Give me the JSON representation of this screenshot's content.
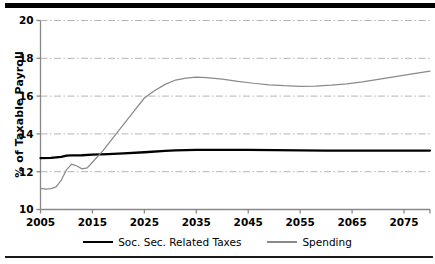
{
  "chart_data": {
    "type": "line",
    "title": "",
    "xlabel": "",
    "ylabel": "% of Taxable Payroll",
    "xlim": [
      2005,
      2080
    ],
    "ylim": [
      10,
      20
    ],
    "yticks": [
      10,
      12,
      14,
      16,
      18,
      20
    ],
    "xticks": [
      2005,
      2015,
      2025,
      2035,
      2045,
      2055,
      2065,
      2075
    ],
    "grid": "horizontal dash-dot gridlines at 12, 14, 16, 18, 20",
    "legend_position": "bottom-center",
    "series": [
      {
        "name": "Soc. Sec. Related Taxes",
        "color": "#000000",
        "x": [
          2005,
          2007,
          2009,
          2010,
          2011,
          2013,
          2015,
          2018,
          2021,
          2025,
          2029,
          2031,
          2035,
          2040,
          2045,
          2050,
          2055,
          2060,
          2065,
          2070,
          2075,
          2080
        ],
        "values": [
          12.72,
          12.73,
          12.78,
          12.85,
          12.86,
          12.87,
          12.9,
          12.93,
          12.97,
          13.03,
          13.1,
          13.13,
          13.15,
          13.15,
          13.15,
          13.14,
          13.13,
          13.12,
          13.12,
          13.12,
          13.12,
          13.12
        ]
      },
      {
        "name": "Spending",
        "color": "#8a8a8a",
        "x": [
          2005,
          2006,
          2007,
          2008,
          2009,
          2010,
          2011,
          2012,
          2013,
          2014,
          2015,
          2017,
          2019,
          2021,
          2023,
          2025,
          2027,
          2029,
          2031,
          2033,
          2035,
          2037,
          2040,
          2043,
          2046,
          2049,
          2052,
          2055,
          2058,
          2061,
          2064,
          2067,
          2070,
          2073,
          2076,
          2080
        ],
        "values": [
          11.12,
          11.08,
          11.1,
          11.2,
          11.55,
          12.1,
          12.4,
          12.3,
          12.15,
          12.2,
          12.5,
          13.1,
          13.8,
          14.5,
          15.2,
          15.9,
          16.3,
          16.62,
          16.85,
          16.95,
          17.0,
          16.98,
          16.9,
          16.78,
          16.68,
          16.6,
          16.55,
          16.52,
          16.53,
          16.58,
          16.65,
          16.75,
          16.88,
          17.02,
          17.15,
          17.32
        ]
      }
    ]
  },
  "axis": {
    "y_title": "% of Taxable Payroll",
    "y_tick_labels": [
      "20",
      "18",
      "16",
      "14",
      "12",
      "10"
    ],
    "x_tick_labels": [
      "2005",
      "2015",
      "2025",
      "2035",
      "2045",
      "2055",
      "2065",
      "2075"
    ]
  },
  "legend": {
    "entries": [
      {
        "label": "Soc. Sec. Related Taxes",
        "color": "#000000"
      },
      {
        "label": "Spending",
        "color": "#8a8a8a"
      }
    ]
  },
  "colors": {
    "taxes": "#000000",
    "spending": "#8a8a8a",
    "gridline": "#b4b4b4",
    "axis": "#888888",
    "rule": "#000000"
  }
}
